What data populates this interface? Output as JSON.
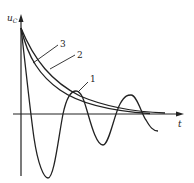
{
  "diagram": {
    "type": "waveform-sketch",
    "y_axis_label": "u",
    "y_axis_subscript": "C",
    "x_axis_label": "t",
    "curves": [
      {
        "id": "1",
        "label": "1",
        "description": "underdamped oscillatory decay"
      },
      {
        "id": "2",
        "label": "2",
        "description": "critically damped decay"
      },
      {
        "id": "3",
        "label": "3",
        "description": "overdamped decay"
      }
    ],
    "colors": {
      "stroke": "#222222",
      "background": "#ffffff"
    }
  }
}
